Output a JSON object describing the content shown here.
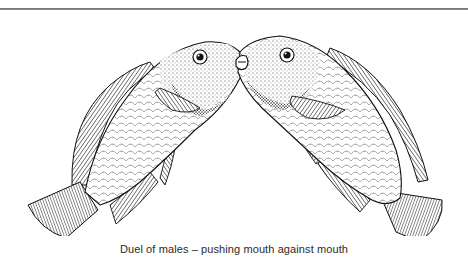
{
  "page": {
    "figure": {
      "subject": "two fish (cichlid males) facing each other, mouths locked",
      "left_fish_icon": "fish-left-icon",
      "right_fish_icon": "fish-right-icon"
    },
    "caption": "Duel of males – pushing mouth against mouth",
    "colors": {
      "rule": "#7a7a7a",
      "ink": "#1a1a1a",
      "caption": "#2a2a2a",
      "background": "#ffffff"
    }
  }
}
